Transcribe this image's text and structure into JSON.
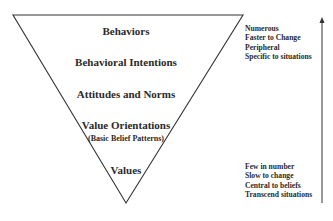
{
  "diagram": {
    "type": "inverted-pyramid",
    "levels": [
      {
        "label": "Behaviors"
      },
      {
        "label": "Behavioral Intentions"
      },
      {
        "label": "Attitudes and Norms"
      },
      {
        "label": "Value Orientations",
        "sublabel": "(Basic Belief Patterns)"
      },
      {
        "label": "Values"
      }
    ],
    "top_descriptors": [
      "Numerous",
      "Faster to Change",
      "Peripheral",
      "Specific to situations"
    ],
    "bottom_descriptors": [
      "Few in number",
      "Slow to change",
      "Central to beliefs",
      "Transcend situations"
    ],
    "arrow_direction": "up"
  }
}
